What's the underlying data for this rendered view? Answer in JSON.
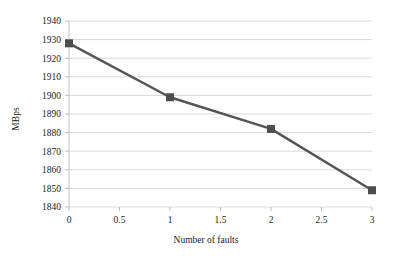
{
  "chart_data": {
    "type": "line",
    "title": "",
    "subtitle": "",
    "xlabel": "Number of faults",
    "ylabel": "MBps",
    "x": [
      0,
      1,
      2,
      3
    ],
    "values": [
      1928,
      1899,
      1882,
      1849
    ],
    "series": [
      {
        "name": "MBps",
        "x": [
          0,
          1,
          2,
          3
        ],
        "values": [
          1928,
          1899,
          1882,
          1849
        ]
      }
    ],
    "xlim": [
      0,
      3
    ],
    "ylim": [
      1840,
      1940
    ],
    "xticks": [
      0,
      0.5,
      1,
      1.5,
      2,
      2.5,
      3
    ],
    "yticks": [
      1840,
      1850,
      1860,
      1870,
      1880,
      1890,
      1900,
      1910,
      1920,
      1930,
      1940
    ],
    "xtick_labels": [
      "0",
      "0.5",
      "1",
      "1.5",
      "2",
      "2.5",
      "3"
    ],
    "ytick_labels": [
      "1840",
      "1850",
      "1860",
      "1870",
      "1880",
      "1890",
      "1900",
      "1910",
      "1920",
      "1930",
      "1940"
    ],
    "grid": {
      "horizontal": true,
      "vertical": false
    },
    "legend": {
      "visible": false,
      "position": "none",
      "entries": []
    },
    "marker": "square",
    "annotations": []
  },
  "style": {
    "series_color": "#555555",
    "marker_color": "#4d4d4d",
    "grid_color": "#d9d9d9",
    "axis_color": "#bfbfbf",
    "text_color": "#1a1a1a",
    "background": "#ffffff"
  }
}
